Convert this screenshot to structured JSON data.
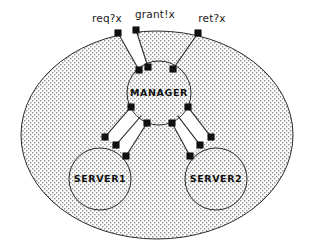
{
  "figure": {
    "kind": "process-network-diagram",
    "background": "#ffffff",
    "stroke_color": "#2b2b2b",
    "fill_pattern": "stipple-dots",
    "pattern_dot_color": "#8a8a8a",
    "port_color": "#111111"
  },
  "outer": {
    "name": "system-boundary",
    "shape": "ellipse",
    "cx": 157,
    "cy": 135,
    "rx": 136,
    "ry": 104
  },
  "channel_labels": [
    {
      "id": "req",
      "text": "req?x",
      "x": 107,
      "y": 22,
      "anchor": "middle"
    },
    {
      "id": "grant",
      "text": "grant!x",
      "x": 155,
      "y": 18,
      "anchor": "middle"
    },
    {
      "id": "ret",
      "text": "ret?x",
      "x": 212,
      "y": 22,
      "anchor": "middle"
    }
  ],
  "nodes": [
    {
      "id": "manager",
      "label": "MANAGER",
      "cx": 159,
      "cy": 93,
      "r": 32,
      "label_dy": 3
    },
    {
      "id": "server1",
      "label": "SERVER1",
      "cx": 100,
      "cy": 179,
      "r": 31,
      "label_dy": 3
    },
    {
      "id": "server2",
      "label": "SERVER2",
      "cx": 216,
      "cy": 179,
      "r": 31,
      "label_dy": 3
    }
  ],
  "boundary_ports": [
    {
      "id": "port-req",
      "x": 118,
      "y": 33
    },
    {
      "id": "port-grant",
      "x": 136,
      "y": 30
    },
    {
      "id": "port-ret",
      "x": 198,
      "y": 33
    }
  ],
  "manager_ports": [
    {
      "id": "mp-req",
      "x": 139,
      "y": 70
    },
    {
      "id": "mp-grant",
      "x": 148,
      "y": 67
    },
    {
      "id": "mp-ret",
      "x": 173,
      "y": 69
    },
    {
      "id": "mp-s1-out",
      "x": 131,
      "y": 107
    },
    {
      "id": "mp-s1-in",
      "x": 147,
      "y": 123
    },
    {
      "id": "mp-s2-out",
      "x": 188,
      "y": 107
    },
    {
      "id": "mp-s2-in",
      "x": 172,
      "y": 123
    }
  ],
  "server_ports": [
    {
      "id": "s1-p-a",
      "x": 105,
      "y": 137
    },
    {
      "id": "s1-p-b",
      "x": 116,
      "y": 145
    },
    {
      "id": "s1-p-c",
      "x": 126,
      "y": 156
    },
    {
      "id": "s2-p-a",
      "x": 211,
      "y": 137
    },
    {
      "id": "s2-p-b",
      "x": 200,
      "y": 145
    },
    {
      "id": "s2-p-c",
      "x": 190,
      "y": 156
    }
  ],
  "channels": [
    {
      "id": "channel-req-grant",
      "from": "system-boundary",
      "to": "manager",
      "style": "band",
      "rails": [
        {
          "x1": 118,
          "y1": 33,
          "x2": 139,
          "y2": 70
        },
        {
          "x1": 136,
          "y1": 30,
          "x2": 148,
          "y2": 67
        }
      ]
    },
    {
      "id": "channel-ret",
      "from": "system-boundary",
      "to": "manager",
      "style": "line",
      "rails": [
        {
          "x1": 198,
          "y1": 33,
          "x2": 173,
          "y2": 69
        }
      ]
    },
    {
      "id": "channel-manager-server1",
      "from": "manager",
      "to": "server1",
      "style": "double-band",
      "rails": [
        {
          "x1": 131,
          "y1": 107,
          "x2": 105,
          "y2": 137
        },
        {
          "x1": 141,
          "y1": 116,
          "x2": 116,
          "y2": 145
        },
        {
          "x1": 147,
          "y1": 123,
          "x2": 126,
          "y2": 156
        }
      ]
    },
    {
      "id": "channel-manager-server2",
      "from": "manager",
      "to": "server2",
      "style": "double-band",
      "rails": [
        {
          "x1": 188,
          "y1": 107,
          "x2": 211,
          "y2": 137
        },
        {
          "x1": 178,
          "y1": 116,
          "x2": 200,
          "y2": 145
        },
        {
          "x1": 172,
          "y1": 123,
          "x2": 190,
          "y2": 156
        }
      ]
    }
  ]
}
